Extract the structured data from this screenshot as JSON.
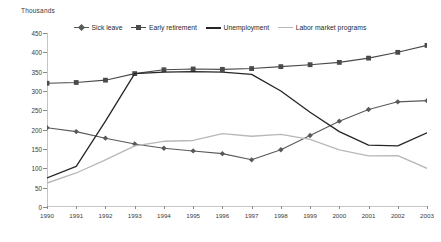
{
  "chart_data": {
    "type": "line",
    "title": "",
    "subtitle": "",
    "unit_label": "Thousands",
    "xlabel": "",
    "ylabel": "",
    "x": [
      1990,
      1991,
      1992,
      1993,
      1994,
      1995,
      1996,
      1997,
      1998,
      1999,
      2000,
      2001,
      2002,
      2003
    ],
    "categories": [
      "1990",
      "1991",
      "1992",
      "1993",
      "1994",
      "1995",
      "1996",
      "1997",
      "1998",
      "1999",
      "2000",
      "2001",
      "2002",
      "2003"
    ],
    "ylim": [
      0,
      450
    ],
    "yticks": [
      0,
      50,
      100,
      150,
      200,
      250,
      300,
      350,
      400,
      450
    ],
    "grid": false,
    "legend_position": "top",
    "series": [
      {
        "name": "Sick leave",
        "marker": "diamond",
        "color": "#595959",
        "values": [
          205,
          195,
          178,
          163,
          152,
          145,
          138,
          122,
          148,
          185,
          222,
          252,
          272,
          275
        ]
      },
      {
        "name": "Early retirement",
        "marker": "square",
        "color": "#4a4a4a",
        "values": [
          320,
          322,
          328,
          345,
          355,
          357,
          356,
          358,
          363,
          368,
          374,
          385,
          400,
          418
        ]
      },
      {
        "name": "Unemployment",
        "marker": "none",
        "color": "#262626",
        "values": [
          75,
          105,
          222,
          345,
          349,
          350,
          349,
          343,
          300,
          245,
          195,
          160,
          158,
          192
        ]
      },
      {
        "name": "Labor market programs",
        "marker": "none",
        "color": "#b8b8b8",
        "values": [
          62,
          88,
          122,
          158,
          170,
          172,
          190,
          183,
          188,
          175,
          148,
          132,
          133,
          100
        ]
      }
    ]
  }
}
